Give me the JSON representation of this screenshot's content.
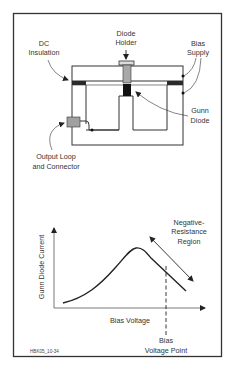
{
  "figure_id": "HBK05_10-34",
  "top_diagram": {
    "labels": {
      "diode_holder": [
        "Diode",
        "Holder"
      ],
      "dc_insulation": [
        "DC",
        "Insulation"
      ],
      "bias_supply": [
        "Bias",
        "Supply"
      ],
      "gunn_diode": [
        "Gunn",
        "Diode"
      ],
      "output_loop": [
        "Output Loop",
        "and Connector"
      ]
    }
  },
  "bottom_chart": {
    "y_axis_label": "Gunn Diode Current",
    "x_axis_label": "Bias Voltage",
    "region_label": [
      "Negative-",
      "Resistance",
      "Region"
    ],
    "bias_point_label": [
      "Bias",
      "Voltage Point"
    ]
  },
  "colors": {
    "line": "#333333",
    "insulation": "#2a2a2a",
    "holder": "#a8a8a8",
    "diode": "#111111",
    "connector": "#a0a0a0"
  }
}
